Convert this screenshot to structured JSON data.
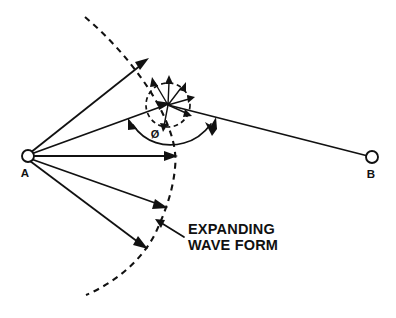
{
  "figure": {
    "type": "physics-wave-propagation-diagram",
    "background_color": "#ffffff",
    "ink_color": "#111111",
    "width": 396,
    "height": 318
  },
  "nodes": [
    {
      "id": "A",
      "label": "A",
      "role": "source-point",
      "x": 28,
      "y": 156,
      "radius": 6,
      "label_x": 24,
      "label_y": 176
    },
    {
      "id": "B",
      "label": "B",
      "role": "receiver-point",
      "x": 372,
      "y": 157,
      "radius": 6,
      "label_x": 368,
      "label_y": 177
    }
  ],
  "hub": {
    "id": "scatter-point",
    "x": 168,
    "y": 105,
    "circle_radius": 22
  },
  "angle": {
    "symbol": "Ø",
    "label_x": 160,
    "label_y": 134,
    "description": "angle between ray A-to-scatter-point and ray scatter-point-to-B"
  },
  "callout": {
    "line1": "EXPANDING",
    "line2": "WAVE FORM",
    "text_x": 186,
    "text_y_line1": 230,
    "text_y_line2": 245,
    "leader_from_x": 182,
    "leader_from_y": 236,
    "leader_to_x": 158,
    "leader_to_y": 222
  },
  "rays_from_A": [
    {
      "name": "ray-upper-outer",
      "to_x": 146,
      "to_y": 62
    },
    {
      "name": "ray-to-scatter-point",
      "to_x": 168,
      "to_y": 105
    },
    {
      "name": "ray-horizontal",
      "to_x": 174,
      "to_y": 156
    },
    {
      "name": "ray-lower-inner",
      "to_x": 164,
      "to_y": 207
    },
    {
      "name": "ray-lower-outer",
      "to_x": 144,
      "to_y": 246
    }
  ],
  "ray_to_B": {
    "name": "ray-scatter-point-to-B",
    "from_x": 168,
    "from_y": 105,
    "to_x": 372,
    "to_y": 157,
    "arrow_at_x": 208,
    "arrow_at_y": 124
  },
  "scatter_arrows": [
    {
      "name": "scatter-arrow-up-left",
      "angle_deg": 250
    },
    {
      "name": "scatter-arrow-up",
      "angle_deg": 284
    },
    {
      "name": "scatter-arrow-up-right",
      "angle_deg": 312
    },
    {
      "name": "scatter-arrow-right",
      "angle_deg": 345
    },
    {
      "name": "scatter-arrow-down-right",
      "angle_deg": 22
    },
    {
      "name": "scatter-arrow-down",
      "angle_deg": 70
    }
  ],
  "wavefront": {
    "name": "expanding-wave-form-arc",
    "description": "large dashed arc centered on A, representing the expanding wave front",
    "start_x": 85,
    "start_y": 17,
    "end_x": 86,
    "end_y": 295
  }
}
